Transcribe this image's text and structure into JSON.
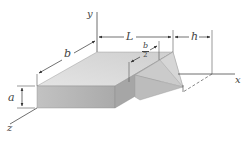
{
  "figure": {
    "axes": {
      "x": "x",
      "y": "y",
      "z": "z"
    },
    "dimensions": {
      "a": "a",
      "b": "b",
      "L": "L",
      "h": "h",
      "b_half_num": "b",
      "b_half_den": "2"
    },
    "colors": {
      "top_face": "#dcdcdc",
      "front_face": "#b4b4b4",
      "side_face": "#a2a2a2",
      "prism_top": "#cdcdcd",
      "prism_side": "#bdbdbd",
      "line": "#4a4a4a"
    }
  }
}
